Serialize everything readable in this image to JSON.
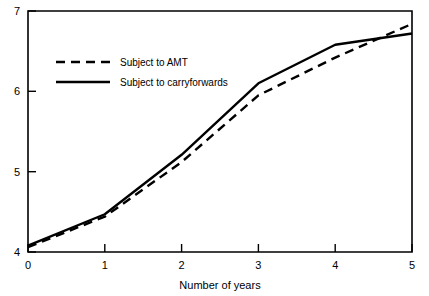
{
  "chart_data": {
    "type": "line",
    "title": "",
    "subtitle": "",
    "xlabel": "Number of years",
    "ylabel": "",
    "xlim": [
      0,
      5
    ],
    "ylim": [
      4,
      7
    ],
    "xticks": [
      0,
      1,
      2,
      3,
      4,
      5
    ],
    "yticks": [
      4,
      5,
      6,
      7
    ],
    "xtick_labels": [
      "0",
      "1",
      "2",
      "3",
      "4",
      "5"
    ],
    "ytick_labels": [
      "4",
      "5",
      "6",
      "7"
    ],
    "grid": false,
    "legend_position": "upper-left-inside",
    "x": [
      0,
      1,
      2,
      3,
      4,
      5
    ],
    "series": [
      {
        "name": "Subject to AMT",
        "style": "dashed",
        "color": "#000000",
        "values": [
          4.06,
          4.44,
          5.12,
          5.95,
          6.42,
          6.84
        ]
      },
      {
        "name": "Subject to carryforwards",
        "style": "solid",
        "color": "#000000",
        "values": [
          4.08,
          4.47,
          5.21,
          6.1,
          6.58,
          6.72
        ]
      }
    ]
  },
  "axes": {
    "x_axis_title": "Number of years",
    "y_axis_title": ""
  },
  "legend": {
    "entries": [
      {
        "label": "Subject to AMT",
        "style": "dashed"
      },
      {
        "label": "Subject to carryforwards",
        "style": "solid"
      }
    ]
  },
  "ticks": {
    "x": [
      "0",
      "1",
      "2",
      "3",
      "4",
      "5"
    ],
    "y": [
      "4",
      "5",
      "6",
      "7"
    ]
  },
  "colors": {
    "line": "#000000",
    "axis": "#000000",
    "background": "#ffffff"
  }
}
